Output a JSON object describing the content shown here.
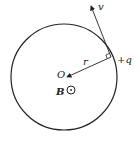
{
  "diagram": {
    "labels": {
      "velocity": "v",
      "radius": "r",
      "charge": "+q",
      "center": "O",
      "field": "B"
    },
    "colors": {
      "stroke": "#222222",
      "background": "#ffffff"
    }
  }
}
